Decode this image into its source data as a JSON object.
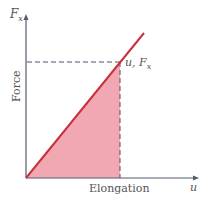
{
  "diagram": {
    "title": "",
    "y_axis_symbol": "F",
    "y_axis_symbol_sub": "x",
    "y_axis_label": "Force",
    "x_axis_label": "Elongation",
    "x_axis_symbol": "u",
    "point_label_u": "u,",
    "point_label_F": "F",
    "point_label_sub": "x",
    "colors": {
      "line": "#c8323c",
      "fill": "#ee9aa6",
      "axis": "#555a6e",
      "dash": "#5a4a6a"
    }
  }
}
